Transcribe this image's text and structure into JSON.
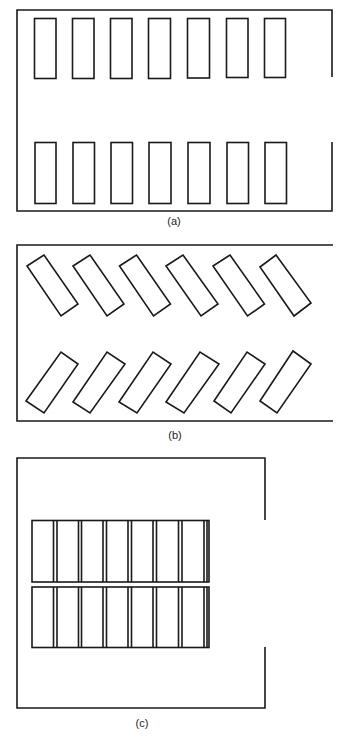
{
  "stroke_color": "#1a1a1a",
  "panels": [
    {
      "id": "a",
      "label": "(a)",
      "description": "Perpendicular (90 degree) parking layout, two rows of seven stalls",
      "stalls_per_row": 7,
      "rows": 2
    },
    {
      "id": "b",
      "label": "(b)",
      "description": "Angled parking layout, two rows of six stalls",
      "stalls_per_row": 6,
      "rows": 2
    },
    {
      "id": "c",
      "label": "(c)",
      "description": "Central double-row block parking layout, two rows of seven stalls",
      "stalls_per_row": 7,
      "rows": 2
    }
  ]
}
